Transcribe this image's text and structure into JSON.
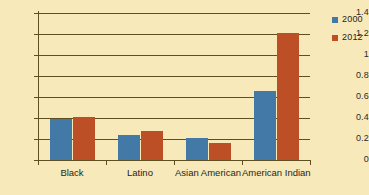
{
  "chart_data": {
    "type": "bar",
    "title": "",
    "subtitle": "",
    "xlabel": "",
    "ylabel": "",
    "categories": [
      "Black",
      "Latino",
      "Asian American",
      "American Indian"
    ],
    "series": [
      {
        "name": "2000",
        "color": "#4379a6",
        "values": [
          0.39,
          0.24,
          0.21,
          0.66
        ]
      },
      {
        "name": "2012",
        "color": "#bd4f26",
        "values": [
          0.41,
          0.28,
          0.16,
          1.21
        ]
      }
    ],
    "ylim": [
      0,
      1.4
    ],
    "ytick_values": [
      0,
      0.2,
      0.4,
      0.6,
      0.8,
      1,
      1.2,
      1.4
    ],
    "ytick_labels": [
      "0",
      "0.2",
      "0.4",
      "0.6",
      "0.8",
      "1",
      "1.2",
      "1.4"
    ],
    "grid": true,
    "grid_axis": "y",
    "legend_position": "right",
    "background_color": "#f7e9b9",
    "axis_color": "#5d4f22"
  }
}
